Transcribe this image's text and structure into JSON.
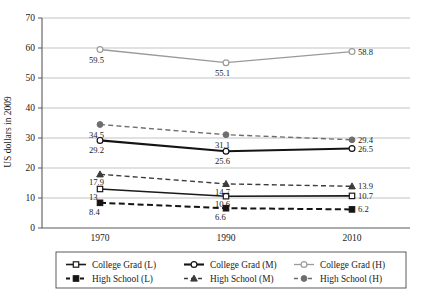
{
  "chart_data": {
    "type": "line",
    "title": "",
    "xlabel": "",
    "ylabel": "US dollars in 2009",
    "categories": [
      "1970",
      "1990",
      "2010"
    ],
    "x": [
      1970,
      1990,
      2010
    ],
    "ylim": [
      0,
      70
    ],
    "yticks": [
      0,
      10,
      20,
      30,
      40,
      50,
      60,
      70
    ],
    "ytick_labels": [
      "0",
      "10",
      "20",
      "30",
      "40",
      "50",
      "60",
      "70"
    ],
    "grid": "horizontal",
    "legend_position": "bottom",
    "series": [
      {
        "name": "College Grad (L)",
        "values": [
          13,
          10.6,
          10.7
        ],
        "labels": [
          "13",
          "10.6",
          "10.7"
        ],
        "marker": "open-square",
        "line_style": "solid",
        "color": "#1a1a1a",
        "width": 1.6
      },
      {
        "name": "College Grad (M)",
        "values": [
          29.2,
          25.6,
          26.5
        ],
        "labels": [
          "29.2",
          "25.6",
          "26.5"
        ],
        "marker": "open-circle",
        "line_style": "solid",
        "color": "#141414",
        "width": 2.1
      },
      {
        "name": "College Grad (H)",
        "values": [
          59.5,
          55.1,
          58.8
        ],
        "labels": [
          "59.5",
          "55.1",
          "58.8"
        ],
        "marker": "open-circle",
        "line_style": "solid",
        "color": "#9a9a9a",
        "width": 1.3
      },
      {
        "name": "High School (L)",
        "values": [
          8.4,
          6.6,
          6.2
        ],
        "labels": [
          "8.4",
          "6.6",
          "6.2"
        ],
        "marker": "filled-square",
        "line_style": "dashed",
        "color": "#141414",
        "width": 2.0
      },
      {
        "name": "High School (M)",
        "values": [
          17.9,
          14.7,
          13.9
        ],
        "labels": [
          "17.9",
          "14.7",
          "13.9"
        ],
        "marker": "filled-triangle",
        "line_style": "dashed",
        "color": "#3c3c3c",
        "width": 1.4
      },
      {
        "name": "High School (H)",
        "values": [
          34.5,
          31.1,
          29.4
        ],
        "labels": [
          "34.5",
          "31.1",
          "29.4"
        ],
        "marker": "filled-circle",
        "line_style": "dashed",
        "color": "#6e6e6e",
        "width": 1.4
      }
    ],
    "label_placement": [
      {
        "series": "College Grad (H)",
        "point": 0,
        "dx": -11,
        "dy": 13,
        "anchor": "start"
      },
      {
        "series": "College Grad (H)",
        "point": 1,
        "dx": -11,
        "dy": 13,
        "anchor": "start"
      },
      {
        "series": "College Grad (H)",
        "point": 2,
        "dx": 6,
        "dy": 3,
        "anchor": "start"
      },
      {
        "series": "High School (H)",
        "point": 0,
        "dx": -11,
        "dy": 13,
        "anchor": "start"
      },
      {
        "series": "High School (H)",
        "point": 1,
        "dx": -11,
        "dy": 13,
        "anchor": "start"
      },
      {
        "series": "High School (H)",
        "point": 2,
        "dx": 6,
        "dy": 3,
        "anchor": "start"
      },
      {
        "series": "College Grad (M)",
        "point": 0,
        "dx": -11,
        "dy": 13,
        "anchor": "start"
      },
      {
        "series": "College Grad (M)",
        "point": 1,
        "dx": -11,
        "dy": 13,
        "anchor": "start"
      },
      {
        "series": "College Grad (M)",
        "point": 2,
        "dx": 6,
        "dy": 3,
        "anchor": "start"
      },
      {
        "series": "High School (M)",
        "point": 0,
        "dx": -11,
        "dy": 11,
        "anchor": "start"
      },
      {
        "series": "High School (M)",
        "point": 1,
        "dx": -11,
        "dy": 11,
        "anchor": "start"
      },
      {
        "series": "High School (M)",
        "point": 2,
        "dx": 6,
        "dy": 3,
        "anchor": "start"
      },
      {
        "series": "College Grad (L)",
        "point": 0,
        "dx": -11,
        "dy": 11,
        "anchor": "start"
      },
      {
        "series": "College Grad (L)",
        "point": 1,
        "dx": -11,
        "dy": 11,
        "anchor": "start"
      },
      {
        "series": "College Grad (L)",
        "point": 2,
        "dx": 6,
        "dy": 3,
        "anchor": "start"
      },
      {
        "series": "High School (L)",
        "point": 0,
        "dx": -11,
        "dy": 12,
        "anchor": "start"
      },
      {
        "series": "High School (L)",
        "point": 1,
        "dx": -11,
        "dy": 12,
        "anchor": "start"
      },
      {
        "series": "High School (L)",
        "point": 2,
        "dx": 6,
        "dy": 3,
        "anchor": "start"
      }
    ]
  },
  "legend": {
    "rows": [
      [
        "College Grad (L)",
        "College Grad (M)",
        "College Grad (H)"
      ],
      [
        "High School (L)",
        "High School (M)",
        "High School (H)"
      ]
    ]
  },
  "colors": {
    "axis": "#5a5a5a",
    "grid": "#9b9b9b",
    "text": "#1a1a1a",
    "background": "#ffffff"
  }
}
